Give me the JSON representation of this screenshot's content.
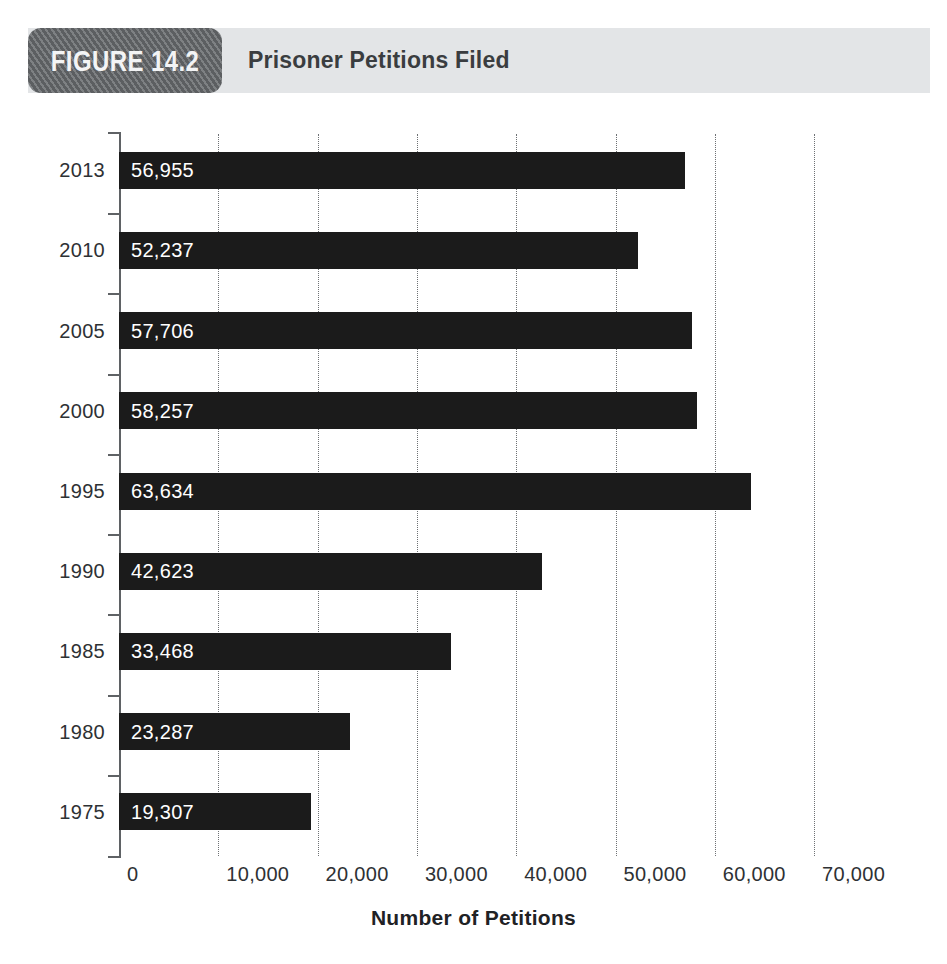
{
  "figure": {
    "badge_label": "FIGURE 14.2",
    "title": "Prisoner Petitions Filed"
  },
  "colors": {
    "header_bar": "#e3e5e7",
    "badge": "#6b6e71",
    "bar": "#1b1b1b",
    "axis": "#5f6265",
    "gridline": "#6e7174",
    "value_label": "#ffffff",
    "text": "#2e3134"
  },
  "chart_data": {
    "type": "bar",
    "orientation": "horizontal",
    "title": "Prisoner Petitions Filed",
    "xlabel": "Number of Petitions",
    "ylabel": "",
    "xlim": [
      0,
      70000
    ],
    "xticks": [
      0,
      10000,
      20000,
      30000,
      40000,
      50000,
      60000,
      70000
    ],
    "xtick_labels": [
      "0",
      "10,000",
      "20,000",
      "30,000",
      "40,000",
      "50,000",
      "60,000",
      "70,000"
    ],
    "grid": "vertical dotted gridlines at each x tick",
    "legend": null,
    "categories": [
      "2013",
      "2010",
      "2005",
      "2000",
      "1995",
      "1990",
      "1985",
      "1980",
      "1975"
    ],
    "values": [
      56955,
      52237,
      57706,
      58257,
      63634,
      42623,
      33468,
      23287,
      19307
    ],
    "value_labels": [
      "56,955",
      "52,237",
      "57,706",
      "58,257",
      "63,634",
      "42,623",
      "33,468",
      "23,287",
      "19,307"
    ],
    "bars": [
      {
        "category": "2013",
        "value": 56955,
        "label": "56,955"
      },
      {
        "category": "2010",
        "value": 52237,
        "label": "52,237"
      },
      {
        "category": "2005",
        "value": 57706,
        "label": "57,706"
      },
      {
        "category": "2000",
        "value": 58257,
        "label": "58,257"
      },
      {
        "category": "1995",
        "value": 63634,
        "label": "63,634"
      },
      {
        "category": "1990",
        "value": 42623,
        "label": "42,623"
      },
      {
        "category": "1985",
        "value": 33468,
        "label": "33,468"
      },
      {
        "category": "1980",
        "value": 23287,
        "label": "23,287"
      },
      {
        "category": "1975",
        "value": 19307,
        "label": "19,307"
      }
    ]
  }
}
